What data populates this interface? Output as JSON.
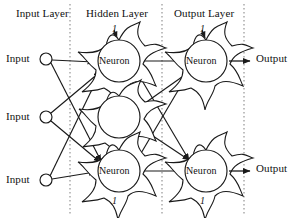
{
  "diagram": {
    "title_labels": [
      {
        "name": "input-layer-title",
        "text": "Input Layer",
        "x": 16,
        "y": 8
      },
      {
        "name": "hidden-layer-title",
        "text": "Hidden Layer",
        "x": 86,
        "y": 8
      },
      {
        "name": "output-layer-title",
        "text": "Output Layer",
        "x": 174,
        "y": 8
      }
    ],
    "input_labels": [
      {
        "text": "Input",
        "x": 6,
        "y": 53
      },
      {
        "text": "Input",
        "x": 6,
        "y": 111
      },
      {
        "text": "Input",
        "x": 6,
        "y": 174
      }
    ],
    "output_labels": [
      {
        "text": "Output",
        "x": 256,
        "y": 53
      },
      {
        "text": "Output",
        "x": 256,
        "y": 163
      }
    ],
    "neuron_labels": [
      {
        "text": "Neuron",
        "x": 99,
        "y": 56
      },
      {
        "text": "Neuron",
        "x": 99,
        "y": 166
      },
      {
        "text": "Neuron",
        "x": 186,
        "y": 56
      },
      {
        "text": "Neuron",
        "x": 186,
        "y": 166
      }
    ],
    "bias_labels": [
      {
        "text": "1",
        "x": 112,
        "y": 24
      },
      {
        "text": "1",
        "x": 200,
        "y": 24
      },
      {
        "text": "1",
        "x": 112,
        "y": 196
      },
      {
        "text": "1",
        "x": 200,
        "y": 196
      }
    ],
    "dividers": [
      {
        "name": "divider-input-hidden",
        "x": 70
      },
      {
        "name": "divider-hidden-output",
        "x": 162
      },
      {
        "name": "divider-output-right",
        "x": 244
      }
    ],
    "input_nodes": [
      {
        "name": "input-node-1",
        "cx": 46,
        "cy": 59,
        "r": 6
      },
      {
        "name": "input-node-2",
        "cx": 46,
        "cy": 117,
        "r": 6
      },
      {
        "name": "input-node-3",
        "cx": 46,
        "cy": 180,
        "r": 6
      }
    ],
    "neuron_bodies": [
      {
        "name": "hidden-neuron-top",
        "cx": 119,
        "cy": 61,
        "r": 21,
        "labeled": true
      },
      {
        "name": "hidden-neuron-middle",
        "cx": 119,
        "cy": 117,
        "r": 21,
        "labeled": false
      },
      {
        "name": "hidden-neuron-bottom",
        "cx": 119,
        "cy": 171,
        "r": 21,
        "labeled": true
      },
      {
        "name": "output-neuron-top",
        "cx": 206,
        "cy": 61,
        "r": 21,
        "labeled": true
      },
      {
        "name": "output-neuron-bottom",
        "cx": 206,
        "cy": 171,
        "r": 21,
        "labeled": true
      }
    ],
    "colors": {
      "stroke": "#1a1a1a",
      "divider": "#8a8a8a",
      "background": "#ffffff",
      "node_fill": "#ffffff"
    }
  }
}
